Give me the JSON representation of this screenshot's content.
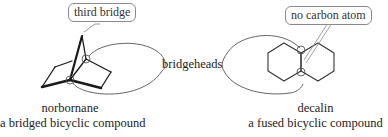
{
  "diagram": {
    "left": {
      "name": "norbornane",
      "description": "a bridged bicyclic compound",
      "callout": "third bridge"
    },
    "center": {
      "label": "bridgeheads"
    },
    "right": {
      "name": "decalin",
      "description": "a fused bicyclic compound",
      "callout": "no carbon atom"
    },
    "colors": {
      "bond": "#1a1a1a",
      "callout_border": "#8a8a8a",
      "loop_line": "#555555",
      "text": "#222222"
    }
  }
}
